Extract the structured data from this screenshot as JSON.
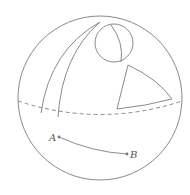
{
  "diagram": {
    "colors": {
      "stroke": "#8a8a8a",
      "text": "#555555",
      "background": "#ffffff"
    },
    "sphere": {
      "cx": 100,
      "cy": 98,
      "r": 82
    },
    "equator": {
      "style": "dashed"
    },
    "shapes": [
      {
        "name": "lune",
        "description": "Two great-circle arcs meeting at top"
      },
      {
        "name": "small-circle",
        "description": "Small circle with an inner arc"
      },
      {
        "name": "spherical-triangle",
        "description": "Curved triangle"
      }
    ],
    "points": [
      {
        "label": "A",
        "x": 59,
        "y": 137
      },
      {
        "label": "B",
        "x": 127,
        "y": 154
      }
    ],
    "segment": {
      "from": "A",
      "to": "B",
      "type": "arc"
    }
  }
}
